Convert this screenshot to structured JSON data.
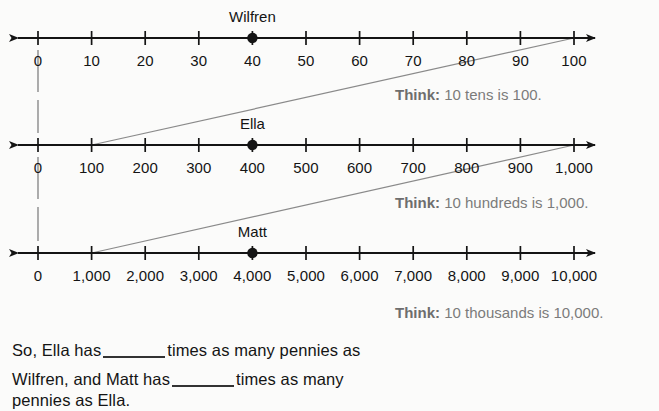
{
  "page": {
    "background_color": "#fbfbfa",
    "ink_color": "#141414",
    "think_color": "#7b7b7b",
    "connector_color": "#8a8a8a"
  },
  "number_lines": [
    {
      "id": "tens",
      "axis_y": 38,
      "marker": {
        "label": "Wilfren",
        "value_index": 4,
        "label_y": 8
      },
      "ticks": [
        "0",
        "10",
        "20",
        "30",
        "40",
        "50",
        "60",
        "70",
        "80",
        "90",
        "100"
      ],
      "think": {
        "prefix": "Think:",
        "text": "10 tens is 100.",
        "x": 395,
        "y": 86
      }
    },
    {
      "id": "hundreds",
      "axis_y": 145,
      "marker": {
        "label": "Ella",
        "value_index": 4,
        "label_y": 115
      },
      "ticks": [
        "0",
        "100",
        "200",
        "300",
        "400",
        "500",
        "600",
        "700",
        "800",
        "900",
        "1,000"
      ],
      "think": {
        "prefix": "Think:",
        "text": "10 hundreds is 1,000.",
        "x": 395,
        "y": 194
      }
    },
    {
      "id": "thousands",
      "axis_y": 253,
      "marker": {
        "label": "Matt",
        "value_index": 4,
        "label_y": 223
      },
      "ticks": [
        "0",
        "1,000",
        "2,000",
        "3,000",
        "4,000",
        "5,000",
        "6,000",
        "7,000",
        "8,000",
        "9,000",
        "10,000"
      ],
      "think": {
        "prefix": "Think:",
        "text": "10 thousands is 10,000.",
        "x": 395,
        "y": 304
      }
    }
  ],
  "axis_geometry": {
    "x_start": 38,
    "x_end": 574,
    "tick_count": 11,
    "tick_spacing": 53.6,
    "tick_half_height": 7,
    "label_offset_y": 22
  },
  "connectors": {
    "diagonals": [
      {
        "from_line": 1,
        "from_tick_index": 1,
        "to_line": 0,
        "to_tick_index": 10
      },
      {
        "from_line": 2,
        "from_tick_index": 1,
        "to_line": 1,
        "to_tick_index": 10
      }
    ],
    "verticals": [
      {
        "tick_index": 0,
        "from_line": 0,
        "to_line": 1
      },
      {
        "tick_index": 0,
        "from_line": 1,
        "to_line": 2
      }
    ]
  },
  "prose": {
    "line1_before": "So, Ella has",
    "line1_after": "times as many pennies as",
    "line2_before": "Wilfren, and Matt has",
    "line2_after": "times as many",
    "line3": "pennies as Ella.",
    "line1_y": 341,
    "line2_y": 370,
    "line3_y": 391,
    "x": 12
  }
}
